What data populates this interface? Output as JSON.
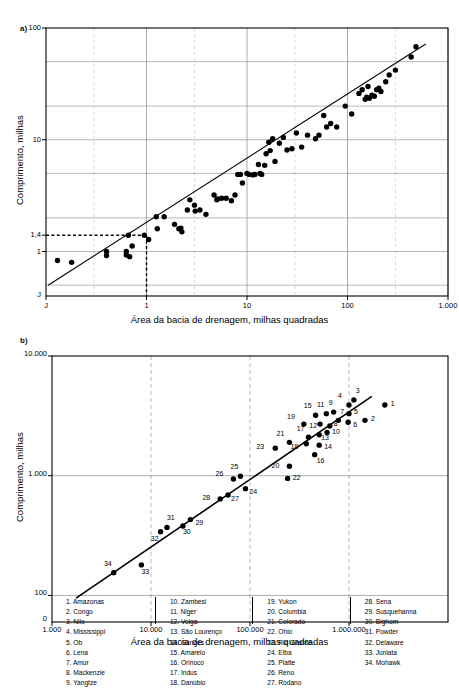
{
  "figure": {
    "panel_a_label": "a)",
    "panel_b_label": "b)"
  },
  "panel_a": {
    "xlabel": "Área da bacia de drenagem, milhas quadradas",
    "ylabel": "Comprimento, milhas",
    "x_ticks": [
      "J",
      "1",
      "10",
      "100",
      "1.000"
    ],
    "y_ticks": [
      "100",
      "10",
      "1,4",
      "1",
      "J"
    ],
    "guide_y_value": "1,4",
    "guide_x_value": "1"
  },
  "panel_b": {
    "xlabel": "Área da bacia de drenagem, milhas quadradas",
    "ylabel": "Comprimento, milhas",
    "x_ticks": [
      "1.000",
      "10.000",
      "100.000",
      "1.000.000"
    ],
    "y_ticks": [
      "10.000",
      "1.000",
      "100",
      "0"
    ]
  },
  "legend": {
    "columns": [
      [
        "1. Amazonas",
        "2. Congo",
        "3. Nilo",
        "4. Mississippi",
        "5. Ob",
        "6. Lena",
        "7. Amur",
        "8. Mackenzie",
        "9. Yangtze"
      ],
      [
        "10. Zambesi",
        "11. Niger",
        "12. Volga",
        "13. São Lourenço",
        "14. Ganges",
        "15. Amarelo",
        "16. Orinoco",
        "17. Indus",
        "18. Danúbio"
      ],
      [
        "19. Yukon",
        "20. Columbia",
        "21. Colorado",
        "22. Ohio",
        "23. Rio Grande",
        "24. Elba",
        "25. Platte",
        "26. Reno",
        "27. Ródano"
      ],
      [
        "28. Sena",
        "29. Susquehanna",
        "30. Bighorn",
        "31. Powder",
        "32. Delaware",
        "33. Juniata",
        "34. Mohawk"
      ]
    ]
  },
  "chart_data": [
    {
      "type": "scatter",
      "id": "panel-a",
      "title": "a)",
      "xlabel": "Área da bacia de drenagem, milhas quadradas",
      "ylabel": "Comprimento, milhas",
      "xscale": "log",
      "yscale": "log",
      "xlim": [
        0.1,
        1000
      ],
      "ylim": [
        0.4,
        100
      ],
      "xtick_values": [
        0.1,
        1,
        10,
        100,
        1000
      ],
      "xtick_labels": [
        "J",
        "1",
        "10",
        "100",
        "1.000"
      ],
      "ytick_values": [
        1,
        1.4,
        10,
        100
      ],
      "ytick_labels": [
        "1",
        "1,4",
        "10",
        "100"
      ],
      "grid": true,
      "legend": "none",
      "annotations": [
        {
          "type": "dashed-guide",
          "y": 1.4,
          "x": 1,
          "label_y": "1,4",
          "label_x": "1"
        }
      ],
      "fit_line": {
        "type": "power-law",
        "x1": 0.105,
        "y1": 0.5,
        "x2": 600,
        "y2": 72
      },
      "points": [
        [
          0.13,
          0.83
        ],
        [
          0.18,
          0.8
        ],
        [
          0.4,
          1.0
        ],
        [
          0.4,
          0.92
        ],
        [
          0.63,
          1.0
        ],
        [
          0.63,
          0.93
        ],
        [
          0.66,
          1.4
        ],
        [
          0.68,
          0.9
        ],
        [
          0.72,
          1.12
        ],
        [
          0.95,
          1.4
        ],
        [
          1.05,
          1.28
        ],
        [
          1.25,
          2.05
        ],
        [
          1.28,
          1.6
        ],
        [
          1.5,
          2.05
        ],
        [
          1.9,
          1.75
        ],
        [
          2.1,
          1.6
        ],
        [
          2.2,
          1.62
        ],
        [
          2.25,
          1.5
        ],
        [
          2.55,
          2.35
        ],
        [
          2.7,
          2.9
        ],
        [
          3.0,
          2.6
        ],
        [
          3.05,
          2.3
        ],
        [
          3.4,
          2.35
        ],
        [
          3.9,
          2.15
        ],
        [
          4.7,
          3.2
        ],
        [
          5.0,
          2.9
        ],
        [
          5.1,
          2.95
        ],
        [
          5.6,
          3.0
        ],
        [
          6.2,
          3.0
        ],
        [
          7.0,
          2.85
        ],
        [
          7.6,
          3.2
        ],
        [
          8.1,
          4.9
        ],
        [
          8.6,
          4.9
        ],
        [
          9.0,
          4.1
        ],
        [
          10.0,
          5.0
        ],
        [
          10.5,
          4.9
        ],
        [
          11.5,
          4.85
        ],
        [
          12.0,
          4.9
        ],
        [
          13.0,
          6.0
        ],
        [
          13.5,
          5.0
        ],
        [
          14.0,
          4.9
        ],
        [
          15.0,
          5.9
        ],
        [
          15.5,
          7.5
        ],
        [
          16.5,
          9.5
        ],
        [
          17.0,
          8.0
        ],
        [
          18.0,
          10.2
        ],
        [
          19.0,
          6.4
        ],
        [
          21.0,
          9.3
        ],
        [
          23.0,
          10.5
        ],
        [
          25.0,
          8.1
        ],
        [
          28.0,
          8.3
        ],
        [
          31.0,
          11.5
        ],
        [
          35.0,
          8.6
        ],
        [
          40.0,
          11.0
        ],
        [
          48.0,
          10.2
        ],
        [
          52.0,
          11.0
        ],
        [
          58.0,
          16.5
        ],
        [
          62.0,
          13.0
        ],
        [
          68.0,
          14.0
        ],
        [
          78.0,
          13.0
        ],
        [
          95.0,
          20.0
        ],
        [
          110.0,
          17.0
        ],
        [
          130.0,
          26.0
        ],
        [
          140.0,
          28.0
        ],
        [
          150.0,
          23.0
        ],
        [
          155.0,
          24.0
        ],
        [
          160.0,
          30.0
        ],
        [
          165.0,
          23.5
        ],
        [
          175.0,
          25.0
        ],
        [
          185.0,
          24.5
        ],
        [
          195.0,
          28.0
        ],
        [
          205.0,
          29.0
        ],
        [
          215.0,
          27.0
        ],
        [
          240.0,
          33.0
        ],
        [
          260.0,
          38.0
        ],
        [
          300.0,
          42.0
        ],
        [
          430.0,
          55.0
        ],
        [
          480.0,
          68.0
        ]
      ]
    },
    {
      "type": "scatter",
      "id": "panel-b",
      "title": "b)",
      "xlabel": "Área da bacia de drenagem, milhas quadradas",
      "ylabel": "Comprimento, milhas",
      "xscale": "log",
      "yscale": "log",
      "xlim": [
        1000,
        10000000
      ],
      "ylim": [
        60,
        10000
      ],
      "xtick_values": [
        1000,
        10000,
        100000,
        1000000
      ],
      "xtick_labels": [
        "1.000",
        "10.000",
        "100.000",
        "1.000.000"
      ],
      "ytick_values": [
        100,
        1000,
        10000
      ],
      "ytick_labels": [
        "100",
        "1.000",
        "10.000"
      ],
      "grid": true,
      "legend": "inside-bottom",
      "fit_line": {
        "type": "power-law",
        "x1": 1750,
        "y1": 95,
        "x2": 1700000,
        "y2": 4600
      },
      "points": [
        {
          "n": 1,
          "x": 2300000,
          "y": 3900,
          "label_dx": 6,
          "label_dy": 1
        },
        {
          "n": 2,
          "x": 1450000,
          "y": 2900,
          "label_dx": 6,
          "label_dy": 1
        },
        {
          "n": 3,
          "x": 1120000,
          "y": 4300,
          "label_dx": 2,
          "label_dy": -7
        },
        {
          "n": 4,
          "x": 1000000,
          "y": 3900,
          "label_dx": -7,
          "label_dy": -7
        },
        {
          "n": 5,
          "x": 1000000,
          "y": 3300,
          "label_dx": 5,
          "label_dy": 0
        },
        {
          "n": 6,
          "x": 980000,
          "y": 2800,
          "label_dx": 5,
          "label_dy": 5
        },
        {
          "n": 7,
          "x": 780000,
          "y": 2900,
          "label_dx": 2,
          "label_dy": -6
        },
        {
          "n": 8,
          "x": 640000,
          "y": 2600,
          "label_dx": 4,
          "label_dy": 0
        },
        {
          "n": 9,
          "x": 700000,
          "y": 3400,
          "label_dx": -1,
          "label_dy": -7
        },
        {
          "n": 10,
          "x": 600000,
          "y": 2300,
          "label_dx": 5,
          "label_dy": 2
        },
        {
          "n": 11,
          "x": 590000,
          "y": 3300,
          "label_dx": -2,
          "label_dy": -7
        },
        {
          "n": 12,
          "x": 510000,
          "y": 2700,
          "label_dx": -3,
          "label_dy": 4
        },
        {
          "n": 13,
          "x": 500000,
          "y": 2200,
          "label_dx": 2,
          "label_dy": 5
        },
        {
          "n": 14,
          "x": 500000,
          "y": 1800,
          "label_dx": 5,
          "label_dy": 4
        },
        {
          "n": 15,
          "x": 460000,
          "y": 3200,
          "label_dx": -4,
          "label_dy": -7
        },
        {
          "n": 16,
          "x": 450000,
          "y": 1500,
          "label_dx": 2,
          "label_dy": 8
        },
        {
          "n": 17,
          "x": 390000,
          "y": 2100,
          "label_dx": -4,
          "label_dy": -6
        },
        {
          "n": 18,
          "x": 370000,
          "y": 1850,
          "label_dx": -8,
          "label_dy": 5
        },
        {
          "n": 19,
          "x": 350000,
          "y": 2700,
          "label_dx": -9,
          "label_dy": -5
        },
        {
          "n": 20,
          "x": 250000,
          "y": 1200,
          "label_dx": -10,
          "label_dy": 2
        },
        {
          "n": 21,
          "x": 250000,
          "y": 1900,
          "label_dx": -5,
          "label_dy": -6
        },
        {
          "n": 22,
          "x": 240000,
          "y": 950,
          "label_dx": 5,
          "label_dy": 2
        },
        {
          "n": 23,
          "x": 180000,
          "y": 1700,
          "label_dx": -11,
          "label_dy": 1
        },
        {
          "n": 24,
          "x": 90000,
          "y": 780,
          "label_dx": 4,
          "label_dy": 5
        },
        {
          "n": 25,
          "x": 80000,
          "y": 990,
          "label_dx": -2,
          "label_dy": -7
        },
        {
          "n": 26,
          "x": 68000,
          "y": 940,
          "label_dx": -10,
          "label_dy": -3
        },
        {
          "n": 27,
          "x": 60000,
          "y": 690,
          "label_dx": 3,
          "label_dy": 6
        },
        {
          "n": 28,
          "x": 50000,
          "y": 640,
          "label_dx": -10,
          "label_dy": 1
        },
        {
          "n": 29,
          "x": 25000,
          "y": 430,
          "label_dx": 5,
          "label_dy": 5
        },
        {
          "n": 30,
          "x": 21000,
          "y": 380,
          "label_dx": 0,
          "label_dy": 8
        },
        {
          "n": 31,
          "x": 14500,
          "y": 370,
          "label_dx": 0,
          "label_dy": -7
        },
        {
          "n": 32,
          "x": 12500,
          "y": 340,
          "label_dx": -2,
          "label_dy": 9
        },
        {
          "n": 33,
          "x": 8000,
          "y": 180,
          "label_dx": 0,
          "label_dy": 9
        },
        {
          "n": 34,
          "x": 4200,
          "y": 155,
          "label_dx": -2,
          "label_dy": -7
        }
      ]
    }
  ]
}
